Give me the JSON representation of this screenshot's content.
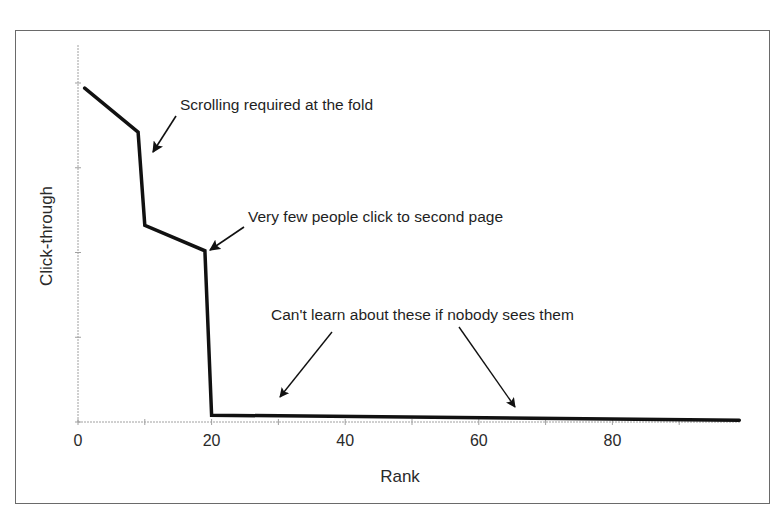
{
  "chart_data": {
    "type": "line",
    "title": "",
    "xlabel": "Rank",
    "ylabel": "Click-through",
    "xlim": [
      0,
      100
    ],
    "ylim": [
      0,
      100
    ],
    "x_ticks": [
      0,
      10,
      20,
      30,
      40,
      50,
      60,
      70,
      80,
      90
    ],
    "x_tick_labels": [
      "0",
      "",
      "20",
      "",
      "40",
      "",
      "60",
      "",
      "80",
      ""
    ],
    "y_ticks": [
      0,
      25,
      50,
      75,
      100
    ],
    "y_tick_labels": [
      "",
      "",
      "",
      "",
      ""
    ],
    "grid": false,
    "legend": null,
    "series": [
      {
        "name": "Click-through",
        "color": "#111111",
        "points": [
          {
            "x": 1,
            "y": 98.5
          },
          {
            "x": 9,
            "y": 85.5
          },
          {
            "x": 10,
            "y": 58
          },
          {
            "x": 19,
            "y": 50.5
          },
          {
            "x": 20,
            "y": 2
          },
          {
            "x": 99,
            "y": 0.5
          }
        ]
      }
    ],
    "annotations": [
      {
        "text": "Scrolling required at the fold",
        "arrow_to": {
          "x": 11,
          "y": 79
        }
      },
      {
        "text": "Very few people click to second page",
        "arrow_to": {
          "x": 20,
          "y": 50
        }
      },
      {
        "text": "Can't learn about these if nobody sees them",
        "arrow_to": [
          {
            "x": 30,
            "y": 7
          },
          {
            "x": 65.5,
            "y": 4
          }
        ]
      }
    ]
  },
  "labels": {
    "xlabel": "Rank",
    "ylabel": "Click-through",
    "annotation_fold": "Scrolling required at the fold",
    "annotation_second_page": "Very few people click to second page",
    "annotation_unseen": "Can't learn about these if nobody sees them",
    "x_tick_0": "0",
    "x_tick_20": "20",
    "x_tick_40": "40",
    "x_tick_60": "60",
    "x_tick_80": "80"
  },
  "colors": {
    "line": "#111111",
    "axis": "#9a9a9a",
    "frame": "#6a6a6a",
    "text": "#2a2a2a"
  }
}
